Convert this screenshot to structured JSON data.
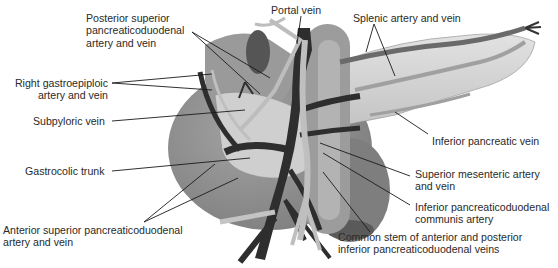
{
  "diagram": {
    "labels": [
      {
        "id": "posterior-superior-pd",
        "lines": [
          "Posterior superior",
          "pancreaticoduodenal",
          "artery and vein"
        ]
      },
      {
        "id": "portal-vein",
        "lines": [
          "Portal vein"
        ]
      },
      {
        "id": "splenic",
        "lines": [
          "Splenic artery and vein"
        ]
      },
      {
        "id": "right-gastroepiploic",
        "lines": [
          "Right gastroepiploic",
          "artery and vein"
        ]
      },
      {
        "id": "subpyloric-vein",
        "lines": [
          "Subpyloric vein"
        ]
      },
      {
        "id": "inferior-pancreatic-vein",
        "lines": [
          "Inferior pancreatic vein"
        ]
      },
      {
        "id": "gastrocolic-trunk",
        "lines": [
          "Gastrocolic trunk"
        ]
      },
      {
        "id": "superior-mesenteric",
        "lines": [
          "Superior mesenteric artery",
          "and vein"
        ]
      },
      {
        "id": "inferior-pd-communis",
        "lines": [
          "Inferior pancreaticoduodenal",
          "communis artery"
        ]
      },
      {
        "id": "anterior-superior-pd",
        "lines": [
          "Anterior superior pancreaticoduodenal",
          "artery and vein"
        ]
      },
      {
        "id": "common-stem",
        "lines": [
          "Common stem of anterior and posterior",
          "inferior pancreaticoduodenal veins"
        ]
      }
    ],
    "colors": {
      "organ_dark": "#8a8a8a",
      "organ_mid": "#a8a8a8",
      "pancreas": "#d4d4d4",
      "vein": "#2e2e2e",
      "artery": "#b9b9b9",
      "leader_line": "#1a1a1a"
    }
  }
}
